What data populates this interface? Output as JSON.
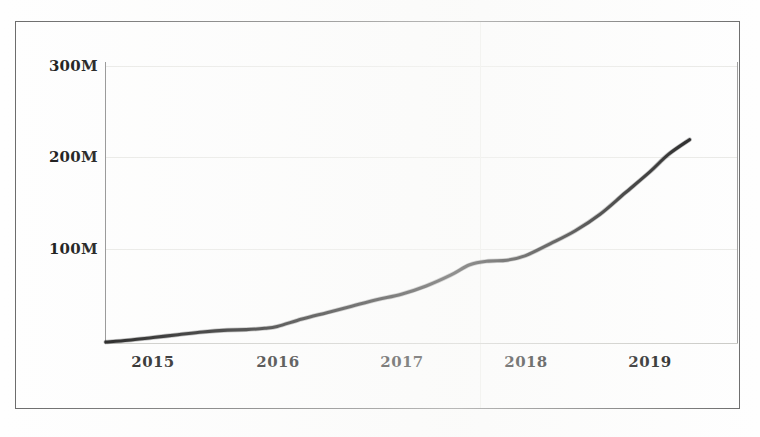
{
  "chart_data": {
    "type": "line",
    "title": "",
    "subtitle": "",
    "xlabel": "",
    "ylabel": "",
    "x_tick_labels": [
      "2015",
      "2016",
      "2017",
      "2018",
      "2019"
    ],
    "x_tick_values": [
      2015,
      2016,
      2017,
      2018,
      2019
    ],
    "y_tick_labels": [
      "100M",
      "200M",
      "300M"
    ],
    "y_tick_values": [
      100000000,
      200000000,
      300000000
    ],
    "ylim": [
      0,
      300000000
    ],
    "xlim": [
      2014.6,
      2019.35
    ],
    "grid": "faint horizontal gridlines at 100M, 200M, 300M",
    "legend": "none",
    "annotations": [],
    "series": [
      {
        "name": "value",
        "color": "#131313",
        "x": [
          2014.62,
          2014.8,
          2015.0,
          2015.2,
          2015.4,
          2015.6,
          2015.75,
          2015.9,
          2016.0,
          2016.2,
          2016.4,
          2016.6,
          2016.8,
          2017.0,
          2017.2,
          2017.4,
          2017.55,
          2017.7,
          2017.85,
          2018.0,
          2018.2,
          2018.4,
          2018.6,
          2018.8,
          2019.0,
          2019.15,
          2019.32
        ],
        "y": [
          1000000,
          3000000,
          6000000,
          9000000,
          12000000,
          14000000,
          14500000,
          16000000,
          18000000,
          26000000,
          33000000,
          40000000,
          47000000,
          53000000,
          62000000,
          74000000,
          85000000,
          89000000,
          90000000,
          95000000,
          108000000,
          122000000,
          140000000,
          163000000,
          186000000,
          205000000,
          221000000
        ]
      }
    ]
  },
  "page": {
    "frame_color": "#6a6a6a",
    "background": "#ffffff",
    "axis_color": "#8e8e8e",
    "gridline_color": "#e9e9e6",
    "series_color": "#131313"
  }
}
